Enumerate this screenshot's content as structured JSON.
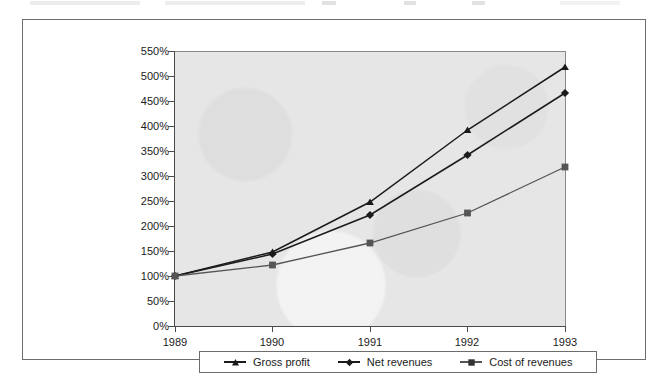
{
  "figure": {
    "background_color": "#ffffff",
    "frame_color": "#6d6d6d",
    "plot_background_color": "#e6e6e6",
    "axis_color": "#4a4a4a"
  },
  "chart_data": {
    "type": "line",
    "title": "",
    "subtitle": "",
    "xlabel": "",
    "ylabel": "",
    "categories": [
      "1989",
      "1990",
      "1991",
      "1992",
      "1993"
    ],
    "x_tick_labels": [
      "1989",
      "1990",
      "1991",
      "1992",
      "1993"
    ],
    "y_tick_labels": [
      "0%",
      "50%",
      "100%",
      "150%",
      "200%",
      "250%",
      "300%",
      "350%",
      "400%",
      "450%",
      "500%",
      "550%"
    ],
    "y_tick_values": [
      0,
      50,
      100,
      150,
      200,
      250,
      300,
      350,
      400,
      450,
      500,
      550
    ],
    "ylim": [
      0,
      550
    ],
    "y_unit": "%",
    "grid": false,
    "legend_position": "bottom",
    "series": [
      {
        "name": "Gross profit",
        "marker": "triangle",
        "color": "#1b1b1b",
        "values": [
          100,
          148,
          248,
          392,
          518
        ]
      },
      {
        "name": "Net revenues",
        "marker": "diamond",
        "color": "#1b1b1b",
        "values": [
          100,
          144,
          222,
          342,
          466
        ]
      },
      {
        "name": "Cost of revenues",
        "marker": "square",
        "color": "#555555",
        "values": [
          100,
          122,
          166,
          226,
          318
        ]
      }
    ]
  },
  "legend": {
    "items": [
      {
        "label": "Gross profit",
        "marker": "triangle-marker"
      },
      {
        "label": "Net revenues",
        "marker": "diamond-marker"
      },
      {
        "label": "Cost of revenues",
        "marker": "square-marker"
      }
    ]
  }
}
